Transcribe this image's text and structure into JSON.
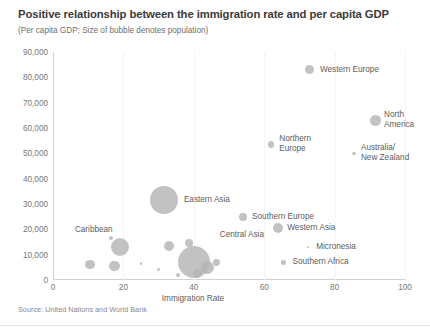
{
  "chart_data": {
    "type": "scatter",
    "title": "Positive relationship between the immigration rate and per capita GDP",
    "subtitle": "(Per capita GDP; Size of bubble denotes population)",
    "source": "Source: United Nations and World Bank",
    "xlabel": "Immigration Rate",
    "ylabel": "",
    "xlim": [
      0,
      100
    ],
    "ylim": [
      0,
      90000
    ],
    "grid": "faint vertical gridlines only",
    "legend": "none; points labelled directly",
    "size_encoding": "bubble area denotes population",
    "xticks": [
      "0",
      "20",
      "40",
      "60",
      "80",
      "100"
    ],
    "xtick_values": [
      0,
      20,
      40,
      60,
      80,
      100
    ],
    "yticks": [
      "0",
      "10,000",
      "20,000",
      "30,000",
      "40,000",
      "50,000",
      "60,000",
      "70,000",
      "80,000",
      "90,000"
    ],
    "ytick_values": [
      0,
      10000,
      20000,
      30000,
      40000,
      50000,
      60000,
      70000,
      80000,
      90000
    ],
    "points": [
      {
        "name": "Western Europe",
        "x": 73,
        "y": 83000,
        "r": 4.5,
        "label": "Western Europe",
        "lx": 10,
        "ly": -5
      },
      {
        "name": "North America",
        "x": 91.5,
        "y": 63000,
        "r": 5.5,
        "label": "North America",
        "lx": 9,
        "ly": -10
      },
      {
        "name": "Northern Europe",
        "x": 62,
        "y": 53500,
        "r": 3.2,
        "label": "Northern\nEurope",
        "lx": 8,
        "ly": -10
      },
      {
        "name": "Australia/New Zealand",
        "x": 85.5,
        "y": 50000,
        "r": 1.6,
        "label": "Australia/\nNew Zealand",
        "lx": 7,
        "ly": -10
      },
      {
        "name": "Eastern Asia",
        "x": 31.5,
        "y": 31500,
        "r": 14.0,
        "label": "Eastern Asia",
        "lx": 20,
        "ly": -5
      },
      {
        "name": "Southern Europe",
        "x": 54,
        "y": 25000,
        "r": 4.0,
        "label": "Southern Europe",
        "lx": 9,
        "ly": -5
      },
      {
        "name": "Western Asia",
        "x": 64,
        "y": 20500,
        "r": 5.2,
        "label": "Western Asia",
        "lx": 9,
        "ly": -5
      },
      {
        "name": "Micronesia",
        "x": 72.5,
        "y": 13000,
        "r": 1.2,
        "label": "Micronesia",
        "lx": 8,
        "ly": -5
      },
      {
        "name": "Southern Africa",
        "x": 65.5,
        "y": 7000,
        "r": 2.3,
        "label": "Southern Africa",
        "lx": 9,
        "ly": -5
      },
      {
        "name": "Caribbean",
        "x": 19,
        "y": 13000,
        "r": 9.0,
        "label": "Caribbean",
        "lx": -45,
        "ly": -22
      },
      {
        "name": "Central Asia",
        "x": 40,
        "y": 7000,
        "r": 16.0,
        "label": "Central Asia",
        "lx": 26,
        "ly": -32
      },
      {
        "name": "bubble-a",
        "x": 16.5,
        "y": 16500,
        "r": 2.2,
        "label": "",
        "lx": 0,
        "ly": 0
      },
      {
        "name": "bubble-b",
        "x": 10.5,
        "y": 6000,
        "r": 4.6,
        "label": "",
        "lx": 0,
        "ly": 0
      },
      {
        "name": "bubble-c",
        "x": 17.5,
        "y": 5500,
        "r": 5.2,
        "label": "",
        "lx": 0,
        "ly": 0
      },
      {
        "name": "bubble-d",
        "x": 25,
        "y": 6500,
        "r": 1.3,
        "label": "",
        "lx": 0,
        "ly": 0
      },
      {
        "name": "bubble-e",
        "x": 33,
        "y": 13500,
        "r": 5.2,
        "label": "",
        "lx": 0,
        "ly": 0
      },
      {
        "name": "bubble-f",
        "x": 38.5,
        "y": 14500,
        "r": 4.0,
        "label": "",
        "lx": 0,
        "ly": 0
      },
      {
        "name": "bubble-g",
        "x": 30,
        "y": 4000,
        "r": 1.4,
        "label": "",
        "lx": 0,
        "ly": 0
      },
      {
        "name": "bubble-h",
        "x": 44,
        "y": 5000,
        "r": 6.5,
        "label": "",
        "lx": 0,
        "ly": 0
      },
      {
        "name": "bubble-i",
        "x": 46.5,
        "y": 7000,
        "r": 3.4,
        "label": "",
        "lx": 0,
        "ly": 0
      },
      {
        "name": "bubble-j",
        "x": 41,
        "y": 2500,
        "r": 4.5,
        "label": "",
        "lx": 0,
        "ly": 0
      },
      {
        "name": "bubble-k",
        "x": 35.5,
        "y": 2000,
        "r": 2.0,
        "label": "",
        "lx": 0,
        "ly": 0
      }
    ]
  },
  "colors": {
    "bubble": "#b5b5b5",
    "axis": "#d2d2d2",
    "grid": "#f4f4f4",
    "title": "#3b3b3b",
    "text": "#5d5d5d"
  }
}
